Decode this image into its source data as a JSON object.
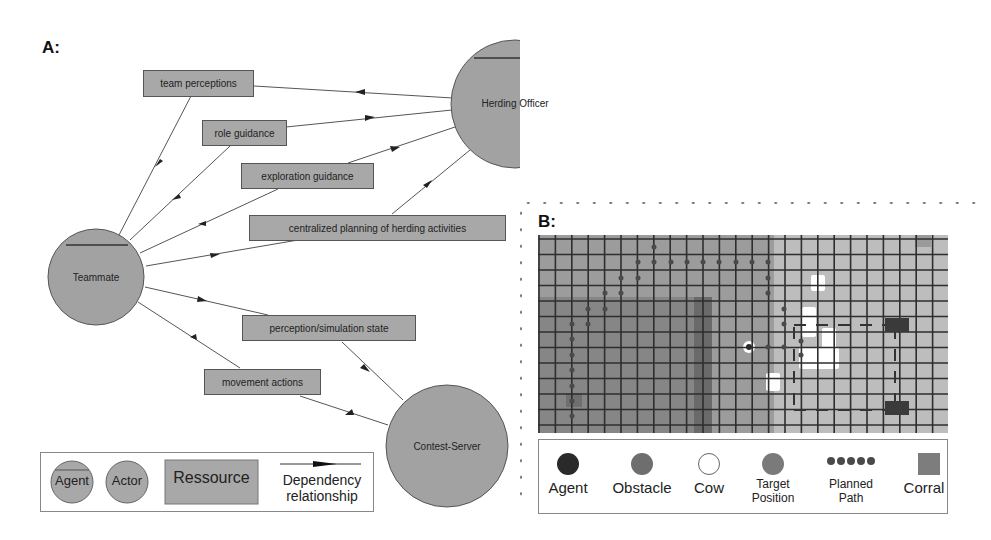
{
  "panel_a": {
    "label": "A:",
    "agents": [
      {
        "id": "herding-officer",
        "label": "Herding Officer",
        "type": "Agent"
      },
      {
        "id": "teammate",
        "label": "Teammate",
        "type": "Agent"
      }
    ],
    "actors": [
      {
        "id": "contest-server",
        "label": "Contest-Server",
        "type": "Actor"
      }
    ],
    "resources": [
      {
        "id": "team-perceptions",
        "label": "team perceptions"
      },
      {
        "id": "role-guidance",
        "label": "role guidance"
      },
      {
        "id": "exploration-guidance",
        "label": "exploration guidance"
      },
      {
        "id": "centralized-planning",
        "label": "centralized planning of herding activities"
      },
      {
        "id": "perception-simulation-state",
        "label": "perception/simulation state"
      },
      {
        "id": "movement-actions",
        "label": "movement actions"
      }
    ],
    "dependencies": [
      {
        "from": "herding-officer",
        "via": "team-perceptions",
        "to": "teammate"
      },
      {
        "from": "teammate",
        "via": "role-guidance",
        "to": "herding-officer"
      },
      {
        "from": "teammate",
        "via": "exploration-guidance",
        "to": "herding-officer"
      },
      {
        "from": "teammate",
        "via": "centralized-planning",
        "to": "herding-officer"
      },
      {
        "from": "teammate",
        "via": "perception-simulation-state",
        "to": "contest-server"
      },
      {
        "from": "contest-server",
        "via": "movement-actions",
        "to": "teammate"
      }
    ],
    "legend": {
      "agent": "Agent",
      "actor": "Actor",
      "resource": "Ressource",
      "dependency_line1": "Dependency",
      "dependency_line2": "relationship"
    }
  },
  "panel_b": {
    "label": "B:",
    "grid": {
      "cols": 25,
      "rows": 13
    },
    "legend": {
      "agent": "Agent",
      "obstacle": "Obstacle",
      "cow": "Cow",
      "target_line1": "Target",
      "target_line2": "Position",
      "path_line1": "Planned",
      "path_line2": "Path",
      "corral": "Corral"
    },
    "colors": {
      "agent": "#2a2a2a",
      "obstacle": "#6e6e6e",
      "cow": "#ffffff",
      "target": "#7a7a7a",
      "path": "#4a4a4a",
      "corral": "#7d7d7d",
      "grid_line": "#2e2e2e",
      "cell_light": "#b8b8b8",
      "cell_dark": "#8a8a8a"
    }
  }
}
